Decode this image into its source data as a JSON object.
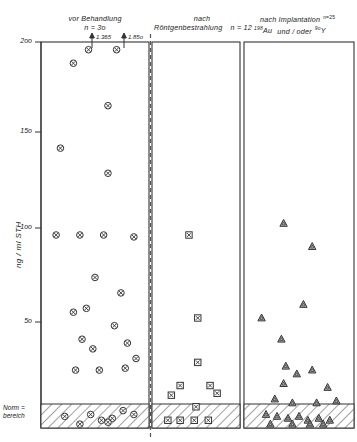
{
  "figure": {
    "axis": {
      "ylabel": "ng / ml  STH",
      "tick_labels": [
        "2oo",
        "15o",
        "1oo",
        "5o"
      ],
      "tick_values": [
        200,
        150,
        100,
        50
      ],
      "norm_label_line1": "Norm =",
      "norm_label_line2": "bereich"
    },
    "panels": [
      {
        "title_line1": "vor Behandlung",
        "title_line2": "n = 3o",
        "n_label": "n = 3o",
        "marker": "circle-x",
        "annotations": [
          {
            "text": "1.365"
          },
          {
            "text": "1.85o"
          }
        ]
      },
      {
        "title_line1": "nach",
        "title_line2": "Röntgenbestrahlung",
        "n_label": "n = 12",
        "marker": "square-x",
        "annotations": []
      },
      {
        "title_line1": "nach Implantation",
        "title_line2_pre": "Au",
        "title_line2_sup1": "198",
        "title_line2_mid": "und / oder",
        "title_line2_sup2": "9o",
        "title_line2_post": "Y",
        "n_label": "n=25",
        "marker": "triangle",
        "annotations": []
      }
    ]
  },
  "chart_data": {
    "type": "scatter",
    "title": "",
    "xlabel": "",
    "ylabel": "ng / ml  STH",
    "ylim": [
      0,
      200
    ],
    "yticks": [
      50,
      100,
      150,
      200
    ],
    "ytick_labels": [
      "5o",
      "1oo",
      "15o",
      "2oo"
    ],
    "grid": false,
    "legend": "none",
    "normal_range_band": {
      "label": "Normbereich",
      "y_from": 0,
      "y_to": 8
    },
    "series": [
      {
        "name": "vor Behandlung",
        "n": 30,
        "marker": "circle-x",
        "group_label": "vor Behandlung  n = 3o",
        "offscale_values": [
          1365,
          1850
        ],
        "points": [
          {
            "x": 0.3,
            "y": 189
          },
          {
            "x": 0.44,
            "y": 196
          },
          {
            "x": 0.7,
            "y": 196
          },
          {
            "x": 0.62,
            "y": 167
          },
          {
            "x": 0.18,
            "y": 145
          },
          {
            "x": 0.62,
            "y": 132
          },
          {
            "x": 0.14,
            "y": 100
          },
          {
            "x": 0.36,
            "y": 100
          },
          {
            "x": 0.58,
            "y": 100
          },
          {
            "x": 0.86,
            "y": 99
          },
          {
            "x": 0.5,
            "y": 78
          },
          {
            "x": 0.74,
            "y": 70
          },
          {
            "x": 0.3,
            "y": 60
          },
          {
            "x": 0.42,
            "y": 62
          },
          {
            "x": 0.68,
            "y": 53
          },
          {
            "x": 0.38,
            "y": 46
          },
          {
            "x": 0.48,
            "y": 41
          },
          {
            "x": 0.8,
            "y": 44
          },
          {
            "x": 0.88,
            "y": 36
          },
          {
            "x": 0.32,
            "y": 30
          },
          {
            "x": 0.54,
            "y": 30
          },
          {
            "x": 0.78,
            "y": 31
          },
          {
            "x": 0.46,
            "y": 7
          },
          {
            "x": 0.66,
            "y": 5
          },
          {
            "x": 0.76,
            "y": 9
          },
          {
            "x": 0.22,
            "y": 6
          },
          {
            "x": 0.56,
            "y": 4
          },
          {
            "x": 0.86,
            "y": 7
          },
          {
            "x": 0.62,
            "y": 3
          },
          {
            "x": 0.36,
            "y": 2
          }
        ]
      },
      {
        "name": "nach Röntgenbestrahlung",
        "n": 12,
        "marker": "square-x",
        "group_label": "nach Röntgenbestrahlung  n = 12",
        "offscale_values": [],
        "points": [
          {
            "x": 0.42,
            "y": 100
          },
          {
            "x": 0.52,
            "y": 57
          },
          {
            "x": 0.52,
            "y": 34
          },
          {
            "x": 0.32,
            "y": 22
          },
          {
            "x": 0.66,
            "y": 22
          },
          {
            "x": 0.74,
            "y": 18
          },
          {
            "x": 0.22,
            "y": 17
          },
          {
            "x": 0.5,
            "y": 11
          },
          {
            "x": 0.18,
            "y": 4
          },
          {
            "x": 0.32,
            "y": 4
          },
          {
            "x": 0.48,
            "y": 4
          },
          {
            "x": 0.64,
            "y": 4
          }
        ]
      },
      {
        "name": "nach Implantation 198Au und/oder 9oY",
        "n": 25,
        "marker": "triangle",
        "group_label": "nach Implantation 198Au und / oder 9oY  n=25",
        "offscale_values": [],
        "points": [
          {
            "x": 0.36,
            "y": 106
          },
          {
            "x": 0.62,
            "y": 94
          },
          {
            "x": 0.54,
            "y": 64
          },
          {
            "x": 0.16,
            "y": 57
          },
          {
            "x": 0.34,
            "y": 46
          },
          {
            "x": 0.38,
            "y": 32
          },
          {
            "x": 0.48,
            "y": 28
          },
          {
            "x": 0.62,
            "y": 30
          },
          {
            "x": 0.36,
            "y": 23
          },
          {
            "x": 0.76,
            "y": 21
          },
          {
            "x": 0.28,
            "y": 15
          },
          {
            "x": 0.44,
            "y": 13
          },
          {
            "x": 0.66,
            "y": 13
          },
          {
            "x": 0.84,
            "y": 14
          },
          {
            "x": 0.2,
            "y": 7
          },
          {
            "x": 0.3,
            "y": 6
          },
          {
            "x": 0.4,
            "y": 5
          },
          {
            "x": 0.5,
            "y": 6
          },
          {
            "x": 0.58,
            "y": 4
          },
          {
            "x": 0.68,
            "y": 5
          },
          {
            "x": 0.78,
            "y": 4
          },
          {
            "x": 0.24,
            "y": 2
          },
          {
            "x": 0.44,
            "y": 2
          },
          {
            "x": 0.6,
            "y": 2
          },
          {
            "x": 0.72,
            "y": 2
          }
        ]
      }
    ]
  }
}
